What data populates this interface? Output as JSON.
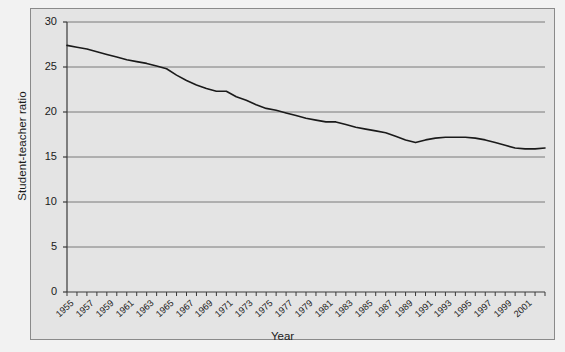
{
  "chart_data": {
    "type": "line",
    "title": "",
    "xlabel": "Year",
    "ylabel": "Student-teacher ratio",
    "xlim": [
      1955,
      2003
    ],
    "ylim": [
      0,
      30
    ],
    "grid": true,
    "legend": null,
    "yticks": [
      0,
      5,
      10,
      15,
      20,
      25,
      30
    ],
    "ytick_labels": [
      "0",
      "5",
      "10",
      "15",
      "20",
      "25",
      "30"
    ],
    "xtick_labels": [
      "1955",
      "1957",
      "1959",
      "1961",
      "1963",
      "1965",
      "1967",
      "1969",
      "1971",
      "1973",
      "1975",
      "1977",
      "1979",
      "1981",
      "1983",
      "1985",
      "1987",
      "1989",
      "1991",
      "1993",
      "1995",
      "1997",
      "1999",
      "2001"
    ],
    "line_color": "#1a1a1a",
    "plot_background": "#e4e4e4",
    "series": [
      {
        "name": "Student-teacher ratio",
        "x": [
          1955,
          1956,
          1957,
          1958,
          1959,
          1960,
          1961,
          1962,
          1963,
          1964,
          1965,
          1966,
          1967,
          1968,
          1969,
          1970,
          1971,
          1972,
          1973,
          1974,
          1975,
          1976,
          1977,
          1978,
          1979,
          1980,
          1981,
          1982,
          1983,
          1984,
          1985,
          1986,
          1987,
          1988,
          1989,
          1990,
          1991,
          1992,
          1993,
          1994,
          1995,
          1996,
          1997,
          1998,
          1999,
          2000,
          2001,
          2002,
          2003
        ],
        "y": [
          27.4,
          27.2,
          27.0,
          26.7,
          26.4,
          26.1,
          25.8,
          25.6,
          25.4,
          25.1,
          24.8,
          24.1,
          23.5,
          23.0,
          22.6,
          22.3,
          22.3,
          21.7,
          21.3,
          20.8,
          20.4,
          20.2,
          19.9,
          19.6,
          19.3,
          19.1,
          18.9,
          18.9,
          18.6,
          18.3,
          18.1,
          17.9,
          17.7,
          17.3,
          16.9,
          16.6,
          16.9,
          17.1,
          17.2,
          17.2,
          17.2,
          17.1,
          16.9,
          16.6,
          16.3,
          16.0,
          15.9,
          15.9,
          16.0
        ]
      }
    ]
  },
  "axis": {
    "y_title": "Student-teacher ratio",
    "x_title": "Year"
  }
}
